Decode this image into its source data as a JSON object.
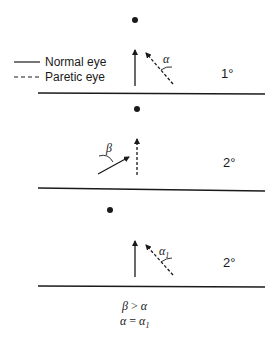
{
  "legend": {
    "normal_label": "Normal eye",
    "paretic_label": "Paretic eye"
  },
  "panels": [
    {
      "gaze_label": "1°",
      "angle_label": "α",
      "description": "Fixation with normal eye; paretic eye deviates by angle α"
    },
    {
      "gaze_label": "2°",
      "angle_label": "β",
      "description": "Fixation with paretic eye; normal eye deviates by angle β"
    },
    {
      "gaze_label": "2°",
      "angle_label": "α",
      "angle_subscript": "1",
      "description": "Paretic eye deviates by angle α1"
    }
  ],
  "footer": {
    "line1_left": "β",
    "line1_op": ">",
    "line1_right": "α",
    "line2_left": "α",
    "line2_op": "=",
    "line2_right": "α",
    "line2_right_sub": "1"
  },
  "colors": {
    "ink": "#1a1a1a",
    "background": "#ffffff"
  }
}
